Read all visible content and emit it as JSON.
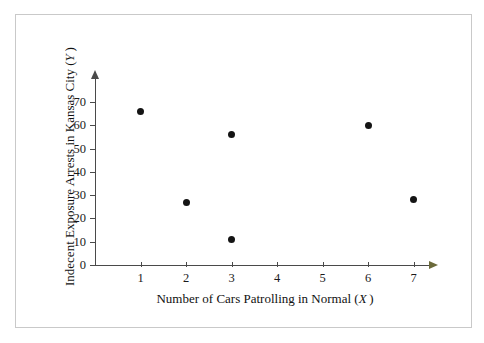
{
  "chart_data": {
    "type": "scatter",
    "title": "",
    "xlabel": "Number of Cars Patrolling in Normal (X)",
    "ylabel": "Indecent Exposure Arrests in Kansas City (Y)",
    "xlabel_text": "Number of Cars Patrolling in Normal",
    "xlabel_var": "X",
    "ylabel_text": "Indecent Exposure Arrests in Kansas City",
    "ylabel_var": "Y",
    "x": [
      1,
      2,
      3,
      3,
      6,
      7
    ],
    "y": [
      66,
      27,
      56,
      11,
      60,
      28
    ],
    "points": [
      {
        "x": 1,
        "y": 66
      },
      {
        "x": 2,
        "y": 27
      },
      {
        "x": 3,
        "y": 56
      },
      {
        "x": 3,
        "y": 11
      },
      {
        "x": 6,
        "y": 60
      },
      {
        "x": 7,
        "y": 28
      }
    ],
    "xlim": [
      0,
      7.8
    ],
    "ylim": [
      0,
      78
    ],
    "xticks": [
      1,
      2,
      3,
      4,
      5,
      6,
      7
    ],
    "xtick_labels": [
      "1",
      "2",
      "3",
      "4",
      "5",
      "6",
      "7"
    ],
    "yticks": [
      0,
      10,
      20,
      30,
      40,
      50,
      60,
      70
    ],
    "ytick_labels": [
      "0",
      "10",
      "20",
      "30",
      "40",
      "50",
      "60",
      "70"
    ],
    "grid": false,
    "legend": false,
    "marker_color": "#141414",
    "axis_color": "#4a4a4a",
    "frame_color": "#c9c9c9"
  }
}
